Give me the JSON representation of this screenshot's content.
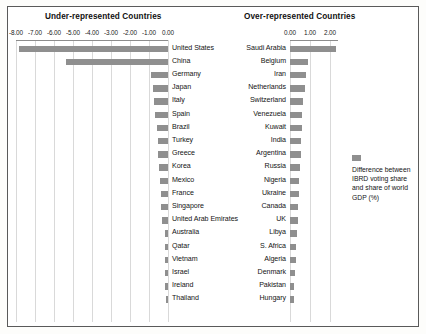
{
  "figure": {
    "accent_color": "#8f8f8f",
    "border_color": "#5a5a5a",
    "gridline_color": "#d9d9d9"
  },
  "panels": {
    "left_title": "Under-represented Countries",
    "right_title": "Over-represented Countries"
  },
  "legend": {
    "swatch_name": "series-swatch",
    "text": "Difference between IBRD voting share and share of world GDP (%)"
  },
  "chart_data": {
    "type": "bar",
    "title": "Difference between IBRD voting share and share of world GDP (%)",
    "subtitle": "",
    "orientation": "horizontal",
    "xlabel": "Difference between IBRD voting share and share of world GDP (%)",
    "ylabel": "",
    "grid": true,
    "legend_position": "right",
    "panels": [
      {
        "name": "Under-represented Countries",
        "xlim": [
          -8.0,
          0.0
        ],
        "xticks": [
          -8.0,
          -7.0,
          -6.0,
          -5.0,
          -4.0,
          -3.0,
          -2.0,
          -1.0,
          0.0
        ],
        "xtick_labels": [
          "-8.00",
          "-7.00",
          "-6.00",
          "-5.00",
          "-4.00",
          "-3.00",
          "-2.00",
          "-1.00",
          "0.00"
        ],
        "categories": [
          "United States",
          "China",
          "Germany",
          "Japan",
          "Italy",
          "Spain",
          "Brazil",
          "Turkey",
          "Greece",
          "Korea",
          "Mexico",
          "France",
          "Singapore",
          "United Arab Emirates",
          "Australia",
          "Qatar",
          "Vietnam",
          "Israel",
          "Ireland",
          "Thailand"
        ],
        "values": [
          -7.85,
          -5.35,
          -0.92,
          -0.8,
          -0.74,
          -0.68,
          -0.57,
          -0.55,
          -0.52,
          -0.5,
          -0.4,
          -0.38,
          -0.36,
          -0.34,
          -0.18,
          -0.17,
          -0.16,
          -0.15,
          -0.14,
          -0.13
        ]
      },
      {
        "name": "Over-represented Countries",
        "xlim": [
          0.0,
          2.4
        ],
        "xticks": [
          0.0,
          1.0,
          2.0
        ],
        "xtick_labels": [
          "0.00",
          "1.00",
          "2.00"
        ],
        "categories": [
          "Saudi Arabia",
          "Belgium",
          "Iran",
          "Netherlands",
          "Switzerland",
          "Venezuela",
          "Kuwait",
          "India",
          "Argentina",
          "Russia",
          "Nigeria",
          "Ukraine",
          "Canada",
          "UK",
          "Libya",
          "S. Africa",
          "Algeria",
          "Denmark",
          "Pakistan",
          "Hungary"
        ],
        "values": [
          2.28,
          0.9,
          0.78,
          0.74,
          0.66,
          0.62,
          0.58,
          0.56,
          0.54,
          0.52,
          0.46,
          0.44,
          0.42,
          0.4,
          0.34,
          0.32,
          0.3,
          0.26,
          0.22,
          0.2
        ]
      }
    ]
  }
}
